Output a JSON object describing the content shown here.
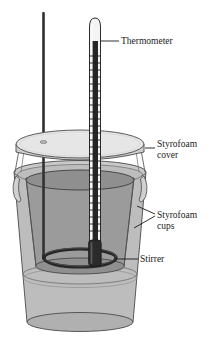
{
  "figure": {
    "background_color": "#ffffff"
  },
  "labels": {
    "thermometer": "Thermometer",
    "cover_line1": "Styrofoam",
    "cover_line2": "cover",
    "cups_line1": "Styrofoam",
    "cups_line2": "cups",
    "stirrer": "Stirrer"
  },
  "parts": {
    "thermometer": {
      "name": "thermometer",
      "body_color": "#f2f2f2",
      "outline_color": "#2b2b2b",
      "mercury_color": "#262626",
      "graduation_color": "#1f1f1f"
    },
    "stirrer": {
      "name": "stirrer",
      "rod_color": "#2e2e2e",
      "ring_color": "#262626"
    },
    "cover": {
      "name": "styrofoam-cover",
      "top_color": "#e3e3e3",
      "edge_color": "#cfcfcf",
      "outline_color": "#4a4a4a"
    },
    "inner_cup": {
      "name": "inner-styrofoam-cup",
      "liquid_color": "#9b9b9b",
      "outline_color": "#3d3d3d"
    },
    "outer_cup": {
      "name": "outer-styrofoam-cup",
      "wall_color": "#b8b8b8",
      "outline_color": "#4a4a4a"
    }
  },
  "leader_lines": {
    "color": "#1a1a1a",
    "width": 0.9
  }
}
